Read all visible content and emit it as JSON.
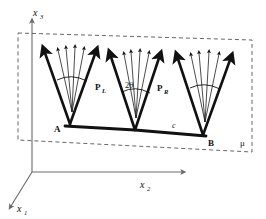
{
  "figure": {
    "kind": "3d-geometry-diagram",
    "background_color": "#ffffff",
    "ink_color": "#111111",
    "dashed_color": "#555555",
    "axis_color": "#777777"
  },
  "axes": {
    "x1": {
      "label": "x",
      "subscript": "1",
      "direction": "down-left"
    },
    "x2": {
      "label": "x",
      "subscript": "2",
      "direction": "right"
    },
    "x3": {
      "label": "x",
      "subscript": "3",
      "direction": "up"
    },
    "origin": {
      "x": 32,
      "y": 172
    }
  },
  "plane": {
    "name": "mu-plane",
    "label": "μ",
    "style": "dashed",
    "corners": [
      {
        "x": 18,
        "y": 33
      },
      {
        "x": 252,
        "y": 40
      },
      {
        "x": 252,
        "y": 152
      },
      {
        "x": 18,
        "y": 140
      }
    ]
  },
  "baseline": {
    "name": "segment-AB",
    "label": "c",
    "start_label": "A",
    "end_label": "B",
    "start_point": {
      "x": 65,
      "y": 126
    },
    "end_point": {
      "x": 206,
      "y": 136
    }
  },
  "vees": [
    {
      "id": "left",
      "vertex": {
        "x": 70,
        "y": 124
      },
      "left_tip": {
        "x": 44,
        "y": 51
      },
      "right_tip": {
        "x": 96,
        "y": 52
      },
      "fan_count": 4,
      "has_arc": true,
      "arc_label": ""
    },
    {
      "id": "middle",
      "vertex": {
        "x": 135,
        "y": 130
      },
      "left_tip": {
        "x": 110,
        "y": 55
      },
      "right_tip": {
        "x": 160,
        "y": 56
      },
      "fan_count": 4,
      "has_arc": true,
      "arc_label": "2θ",
      "left_arm_label": "P",
      "left_arm_subscript": "L",
      "right_arm_label": "P",
      "right_arm_subscript": "R"
    },
    {
      "id": "right",
      "vertex": {
        "x": 203,
        "y": 135
      },
      "left_tip": {
        "x": 177,
        "y": 57
      },
      "right_tip": {
        "x": 231,
        "y": 58
      },
      "fan_count": 4,
      "has_arc": true,
      "arc_label": ""
    }
  ],
  "labels": {
    "x1": "x",
    "x1_sub": "1",
    "x2": "x",
    "x2_sub": "2",
    "x3": "x",
    "x3_sub": "3",
    "A": "A",
    "B": "B",
    "c": "c",
    "mu": "μ",
    "PL": "P",
    "PL_sub": "L",
    "PR": "P",
    "PR_sub": "R",
    "two_theta": "2θ"
  }
}
